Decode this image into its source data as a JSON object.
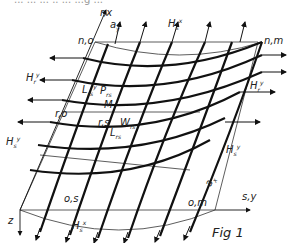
{
  "diagram": {
    "caption": "Fig 1",
    "top_cropped_text": "... ... ... .. ... ...g ...",
    "node_labels": {
      "n0": "n,o",
      "nm": "n,m",
      "r0": "r,o",
      "rs": "r,s",
      "os": "o,s",
      "om": "o,m"
    },
    "axis_labels": {
      "rx": "r,x",
      "sy": "s,y",
      "z": "z"
    },
    "dimension_labels": {
      "ay": "a",
      "ay_sub": "y",
      "ax": "a",
      "ax_sub": "x"
    },
    "force_labels": {
      "Hs_x_top": {
        "base": "H",
        "sub": "s",
        "sup": "x"
      },
      "Hs_x_bottom": {
        "base": "H",
        "sub": "s",
        "sup": "x"
      },
      "Hr_y_left": {
        "base": "H",
        "sub": "r",
        "sup": "y"
      },
      "Hr_y_right": {
        "base": "H",
        "sub": "r",
        "sup": "y"
      },
      "Hs_y_left": {
        "base": "H",
        "sub": "s",
        "sup": "y"
      },
      "Hs_y_right": {
        "base": "H",
        "sub": "s",
        "sup": "y"
      },
      "Prs": {
        "base": "P",
        "sub": "rs"
      },
      "M": {
        "base": "M"
      },
      "Wrs": {
        "base": "W",
        "sub": "rs"
      },
      "Lrs_y": {
        "base": "L",
        "sub": "rs",
        "sup": "y"
      },
      "Lrs_x": {
        "base": "L",
        "sub": "rs",
        "sup": "x"
      }
    }
  }
}
